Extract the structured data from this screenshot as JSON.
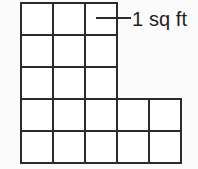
{
  "figure": {
    "title_alt": "Irregular L-shaped polygon drawn on a unit grid",
    "background_color": "#fbfbfb",
    "line_color": "#2b2b2b",
    "cell_fill_color": "#ffffff",
    "label_text_color": "#1f1f1f"
  },
  "annotation": {
    "unit_label": "1 sq ft",
    "leader": {
      "x_start": 96,
      "x_end": 131,
      "y": 18
    },
    "text_position": {
      "x": 132,
      "y": 26
    },
    "font_size": 20
  },
  "grid": {
    "origin_x": 21,
    "origin_y": 3,
    "cell_size": 32,
    "row_count": 5,
    "column_counts": [
      3,
      3,
      3,
      5,
      5
    ],
    "total_cells": 19,
    "total_area_label": "19",
    "unit": "sq ft"
  },
  "cells": [
    {
      "row": 0,
      "col": 0,
      "x": 21,
      "y": 3
    },
    {
      "row": 0,
      "col": 1,
      "x": 53,
      "y": 3
    },
    {
      "row": 0,
      "col": 2,
      "x": 85,
      "y": 3
    },
    {
      "row": 1,
      "col": 0,
      "x": 21,
      "y": 35
    },
    {
      "row": 1,
      "col": 1,
      "x": 53,
      "y": 35
    },
    {
      "row": 1,
      "col": 2,
      "x": 85,
      "y": 35
    },
    {
      "row": 2,
      "col": 0,
      "x": 21,
      "y": 67
    },
    {
      "row": 2,
      "col": 1,
      "x": 53,
      "y": 67
    },
    {
      "row": 2,
      "col": 2,
      "x": 85,
      "y": 67
    },
    {
      "row": 3,
      "col": 0,
      "x": 21,
      "y": 99
    },
    {
      "row": 3,
      "col": 1,
      "x": 53,
      "y": 99
    },
    {
      "row": 3,
      "col": 2,
      "x": 85,
      "y": 99
    },
    {
      "row": 3,
      "col": 3,
      "x": 117,
      "y": 99
    },
    {
      "row": 3,
      "col": 4,
      "x": 149,
      "y": 99
    },
    {
      "row": 4,
      "col": 0,
      "x": 21,
      "y": 131
    },
    {
      "row": 4,
      "col": 1,
      "x": 53,
      "y": 131
    },
    {
      "row": 4,
      "col": 2,
      "x": 85,
      "y": 131
    },
    {
      "row": 4,
      "col": 3,
      "x": 117,
      "y": 131
    },
    {
      "row": 4,
      "col": 4,
      "x": 149,
      "y": 131
    }
  ]
}
